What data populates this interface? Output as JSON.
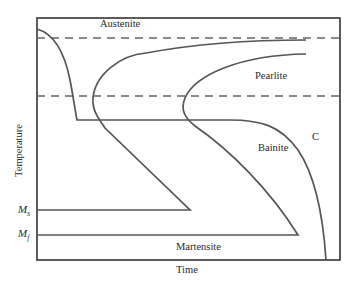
{
  "diagram": {
    "title": "",
    "x_axis_label": "Time",
    "y_axis_label": "Temperature",
    "regions": {
      "austenite": "Austenite",
      "pearlite": "Pearlite",
      "bainite": "Bainite",
      "martensite": "Martensite"
    },
    "curve_label": "C",
    "markers": {
      "ms_main": "M",
      "ms_sub": "s",
      "mf_main": "M",
      "mf_sub": "f"
    },
    "colors": {
      "curve": "#555555",
      "frame": "#333333",
      "dashed": "#666666",
      "text": "#2a2a2a"
    }
  }
}
